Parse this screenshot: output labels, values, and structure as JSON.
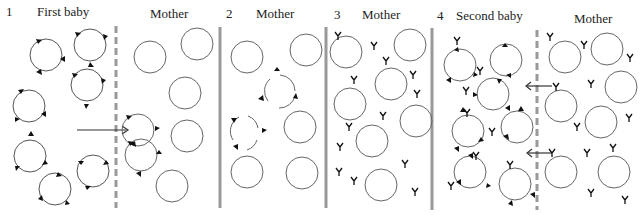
{
  "panels": [
    {
      "number": "1",
      "baby_label": "First baby",
      "mother_label": "Mother"
    },
    {
      "number": "2",
      "mother_label": "Mother"
    },
    {
      "number": "3",
      "mother_label": "Mother"
    },
    {
      "number": "4",
      "baby_label": "Second baby",
      "mother_label": "Mother"
    }
  ],
  "colors": {
    "line": "#555555",
    "divider": "#999999",
    "marker": "#111111"
  }
}
